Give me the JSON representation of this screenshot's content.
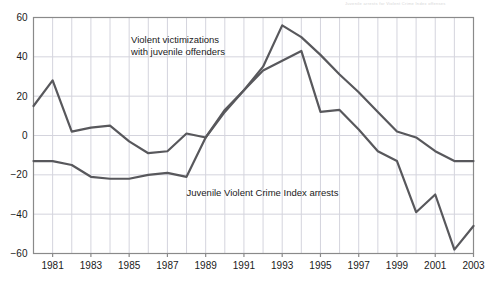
{
  "figure": {
    "header_faint_text": "Juvenile arrests for Violent Crime Index offenses",
    "background_color": "#ffffff",
    "frame_color": "#8a8a8a",
    "grid_color": "#d4d4dd",
    "line_color": "#58585c",
    "text_color": "#1a1a1a"
  },
  "chart_data": {
    "type": "line",
    "title": "",
    "xlabel": "",
    "ylabel": "",
    "xlim": [
      1980,
      2003
    ],
    "ylim": [
      -60,
      60
    ],
    "yticks": [
      60,
      40,
      20,
      0,
      -20,
      -40,
      -60
    ],
    "ytick_labels": [
      "60",
      "40",
      "20",
      "0",
      "−20",
      "−40",
      "−60"
    ],
    "xticks": [
      1981,
      1983,
      1985,
      1987,
      1989,
      1991,
      1993,
      1995,
      1997,
      1999,
      2001,
      2003
    ],
    "xtick_labels": [
      "1981",
      "1983",
      "1985",
      "1987",
      "1989",
      "1991",
      "1993",
      "1995",
      "1997",
      "1999",
      "2001",
      "2003"
    ],
    "grid": true,
    "legend_position": "inline-annotations",
    "x": [
      1980,
      1981,
      1982,
      1983,
      1984,
      1985,
      1986,
      1987,
      1988,
      1989,
      1990,
      1991,
      1992,
      1993,
      1994,
      1995,
      1996,
      1997,
      1998,
      1999,
      2000,
      2001,
      2002,
      2003
    ],
    "series": [
      {
        "name": "Violent victimizations with juvenile offenders",
        "color": "#58585c",
        "values": [
          15,
          28,
          2,
          4,
          5,
          -3,
          -9,
          -8,
          1,
          -1,
          12,
          23,
          35,
          56,
          50,
          41,
          31,
          22,
          12,
          2,
          -1,
          -8,
          -13,
          -13
        ]
      },
      {
        "name": "Juvenile Violent Crime Index arrests",
        "color": "#58585c",
        "values": [
          -13,
          -13,
          -15,
          -21,
          -22,
          -22,
          -20,
          -19,
          -21,
          -1,
          13,
          23,
          33,
          38,
          43,
          12,
          13,
          3,
          -8,
          -13,
          -39,
          -30,
          -58,
          -46
        ]
      }
    ],
    "annotations": [
      {
        "id": "victimizations-label",
        "lines": [
          "Violent victimizations",
          "with juvenile offenders"
        ],
        "x": 1985.1,
        "y": 47
      },
      {
        "id": "arrests-label",
        "lines": [
          "Juvenile Violent Crime Index arrests"
        ],
        "x": 1988.0,
        "y": -31
      }
    ]
  }
}
